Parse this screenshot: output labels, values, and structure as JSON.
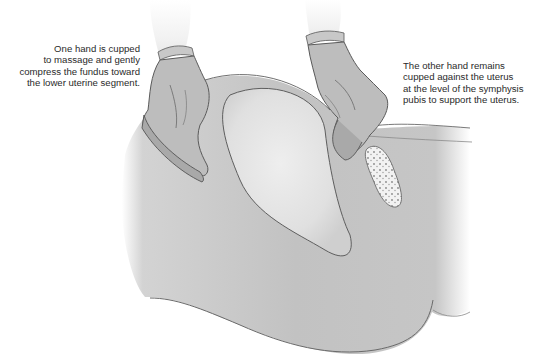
{
  "figure": {
    "caption_left": {
      "lines": [
        "One hand is cupped",
        "to massage and gently",
        "compress the fundus toward",
        "the lower uterine segment."
      ]
    },
    "caption_right": {
      "lines": [
        "The other hand remains",
        "cupped against the uterus",
        "at the level of the symphysis",
        "pubis to support the uterus."
      ]
    },
    "colors": {
      "background": "#ffffff",
      "body_fill": "#c4c4c4",
      "uterus_fill": "#e2e2e2",
      "glove_fill": "#b9b9b9",
      "outline": "#5a5a5a",
      "text": "#2a2a2a"
    }
  }
}
